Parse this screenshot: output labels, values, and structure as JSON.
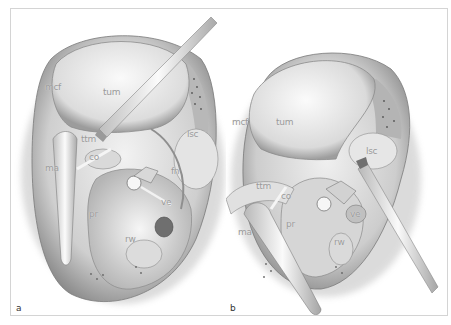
{
  "figure": {
    "panels": [
      {
        "id": "a",
        "letter": "a",
        "labels": {
          "mcf": "mcf",
          "tum": "tum",
          "lsc": "lsc",
          "ttm": "ttm",
          "co": "co",
          "ma": "ma",
          "fn": "fn",
          "ve": "ve",
          "pr": "pr",
          "rw": "rw"
        }
      },
      {
        "id": "b",
        "letter": "b",
        "labels": {
          "mcf": "mcf",
          "tum": "tum",
          "lsc": "lsc",
          "ttm": "ttm",
          "co": "co",
          "ma": "ma",
          "pr": "pr",
          "ve": "ve",
          "rw": "rw"
        }
      }
    ],
    "colors": {
      "frame_border": "#d4d4d4",
      "tissue_light": "#ececec",
      "tissue_mid": "#c4c4c4",
      "tissue_dark": "#6e6e6e",
      "instrument": "#f4f4f4",
      "label": "#9a9a9a"
    }
  }
}
